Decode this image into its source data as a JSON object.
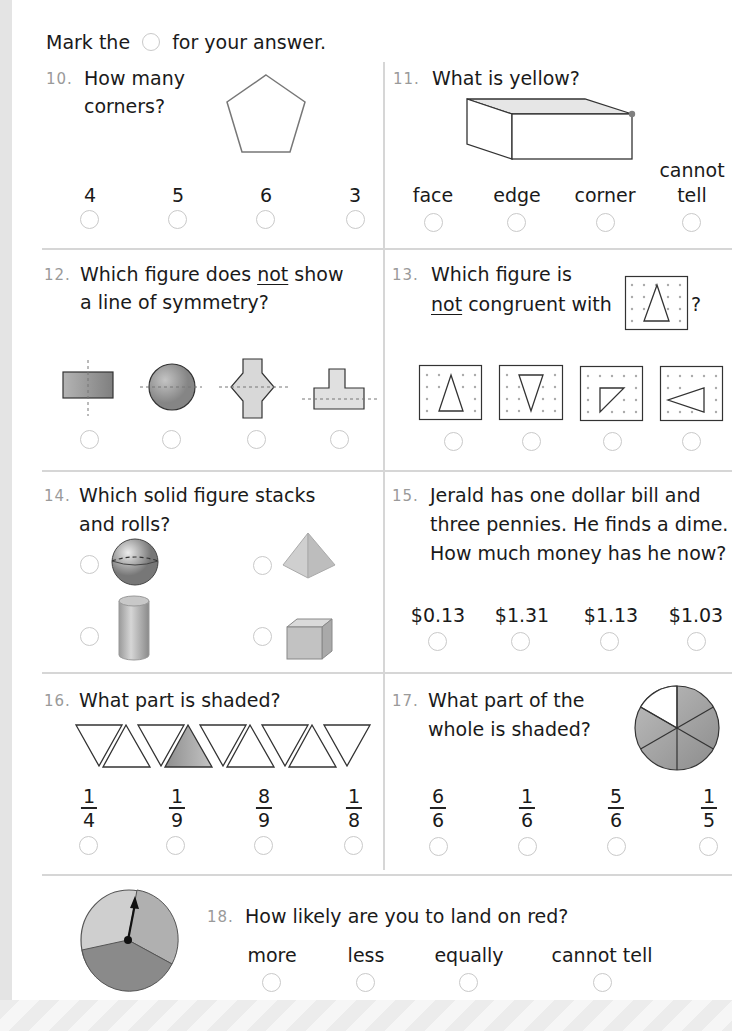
{
  "instruction": {
    "before": "Mark the",
    "after": "for your answer."
  },
  "questions": [
    {
      "number": "10.",
      "lines": [
        "How many",
        "corners?"
      ],
      "figure": "pentagon-icon",
      "options": [
        "4",
        "5",
        "6",
        "3"
      ]
    },
    {
      "number": "11.",
      "lines": [
        "What is yellow?"
      ],
      "figure": "rectangular-prism-icon",
      "options": [
        "face",
        "edge",
        "corner",
        "cannot tell"
      ],
      "option_4_lines": [
        "cannot",
        "tell"
      ]
    },
    {
      "number": "12.",
      "lines": [
        "Which figure does",
        "not",
        "show",
        "a line of symmetry?"
      ],
      "figures": [
        "rectangle-vertical-line-icon",
        "circle-horizontal-line-icon",
        "hexagon-cross-horizontal-line-icon",
        "t-shape-horizontal-line-icon"
      ]
    },
    {
      "number": "13.",
      "lines": [
        "Which figure is",
        "not",
        "congruent with",
        "?"
      ],
      "figures": [
        "dot-grid-triangle-up-icon",
        "dot-grid-triangle-down-icon",
        "dot-grid-right-triangle-icon",
        "dot-grid-triangle-left-icon"
      ]
    },
    {
      "number": "14.",
      "lines": [
        "Which solid figure stacks",
        "and rolls?"
      ],
      "figures": [
        "sphere-icon",
        "pyramid-icon",
        "cylinder-icon",
        "cube-icon"
      ]
    },
    {
      "number": "15.",
      "lines": [
        "Jerald has one dollar bill and",
        "three pennies. He finds a dime.",
        "How much money has he now?"
      ],
      "options": [
        "$0.13",
        "$1.31",
        "$1.13",
        "$1.03"
      ]
    },
    {
      "number": "16.",
      "lines": [
        "What part is shaded?"
      ],
      "figure": "triangle-strip-icon",
      "options": [
        {
          "n": "1",
          "d": "4"
        },
        {
          "n": "1",
          "d": "9"
        },
        {
          "n": "8",
          "d": "9"
        },
        {
          "n": "1",
          "d": "8"
        }
      ]
    },
    {
      "number": "17.",
      "lines": [
        "What part of the",
        "whole is shaded?"
      ],
      "figure": "circle-sixths-icon",
      "options": [
        {
          "n": "6",
          "d": "6"
        },
        {
          "n": "1",
          "d": "6"
        },
        {
          "n": "5",
          "d": "6"
        },
        {
          "n": "1",
          "d": "5"
        }
      ]
    },
    {
      "number": "18.",
      "lines": [
        "How likely are you to land on red?"
      ],
      "figure": "spinner-icon",
      "options": [
        "more",
        "less",
        "equally",
        "cannot tell"
      ]
    }
  ],
  "colors": {
    "divider": "#d6d6d6",
    "bubble": "#c9c9c9",
    "shade": "#9a9a9a",
    "number": "#9a9a9a"
  }
}
